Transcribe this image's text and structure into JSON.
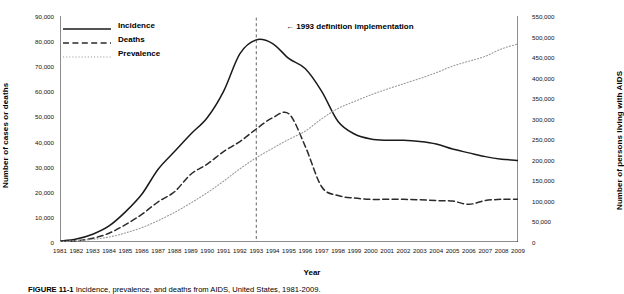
{
  "figure": {
    "caption_label": "FIGURE 11-1",
    "caption_text": "Incidence, prevalence, and deaths from AIDS, United States, 1981-2009."
  },
  "annotation": {
    "arrow": "←",
    "text": "1993 definition implementation",
    "year": 1993
  },
  "legend": {
    "items": [
      {
        "label": "Incidence",
        "style": "solid"
      },
      {
        "label": "Deaths",
        "style": "dashed"
      },
      {
        "label": "Prevalence",
        "style": "dotted"
      }
    ]
  },
  "chart_data": {
    "type": "line",
    "title": "",
    "xlabel": "Year",
    "ylabel": "Number of cases or deaths",
    "ylabel_secondary": "Number of persons living with AIDS",
    "grid": false,
    "legend_position": "top-left",
    "xlim": [
      1981,
      2009
    ],
    "ylim": [
      0,
      90000
    ],
    "ylim_secondary": [
      0,
      550000
    ],
    "xticks": [
      1981,
      1982,
      1983,
      1984,
      1985,
      1986,
      1987,
      1988,
      1989,
      1990,
      1991,
      1992,
      1993,
      1994,
      1995,
      1996,
      1997,
      1998,
      1999,
      2000,
      2001,
      2002,
      2003,
      2004,
      2005,
      2006,
      2007,
      2008,
      2009
    ],
    "yticks": [
      0,
      10000,
      20000,
      30000,
      40000,
      50000,
      60000,
      70000,
      80000,
      90000
    ],
    "yticks_secondary": [
      0,
      50000,
      100000,
      150000,
      200000,
      250000,
      300000,
      350000,
      400000,
      450000,
      500000,
      550000
    ],
    "ytick_labels": [
      "0",
      "10,000",
      "20,000",
      "30,000",
      "40,000",
      "50,000",
      "60,000",
      "70,000",
      "80,000",
      "90,000"
    ],
    "ytick_labels_secondary": [
      "0",
      "50,000",
      "100,000",
      "150,000",
      "200,000",
      "250,000",
      "300,000",
      "350,000",
      "400,000",
      "450,000",
      "500,000",
      "550,000"
    ],
    "x": [
      1981,
      1982,
      1983,
      1984,
      1985,
      1986,
      1987,
      1988,
      1989,
      1990,
      1991,
      1992,
      1993,
      1994,
      1995,
      1996,
      1997,
      1998,
      1999,
      2000,
      2001,
      2002,
      2003,
      2004,
      2005,
      2006,
      2007,
      2008,
      2009
    ],
    "series": [
      {
        "name": "Incidence",
        "axis": "left",
        "style": "solid",
        "values": [
          320,
          1200,
          3100,
          6400,
          12000,
          19000,
          29000,
          36000,
          43000,
          49500,
          60000,
          75000,
          80500,
          79000,
          73000,
          69000,
          60000,
          48000,
          43000,
          41000,
          40500,
          40500,
          40000,
          39000,
          37000,
          35500,
          34000,
          33000,
          32500
        ]
      },
      {
        "name": "Deaths",
        "axis": "left",
        "style": "dashed",
        "values": [
          130,
          460,
          1500,
          3500,
          6900,
          11000,
          16000,
          20000,
          27000,
          31000,
          36000,
          40000,
          45000,
          49500,
          51000,
          38000,
          22000,
          18500,
          17500,
          17000,
          17000,
          17000,
          16800,
          16500,
          16300,
          15000,
          16500,
          17000,
          17000
        ]
      },
      {
        "name": "Prevalence",
        "axis": "right",
        "style": "dotted",
        "values": [
          1200,
          3000,
          6500,
          12000,
          22000,
          35000,
          52000,
          72000,
          95000,
          120000,
          148000,
          178000,
          205000,
          228000,
          250000,
          270000,
          300000,
          325000,
          342000,
          358000,
          372000,
          385000,
          398000,
          412000,
          428000,
          440000,
          452000,
          470000,
          482000
        ]
      }
    ]
  }
}
